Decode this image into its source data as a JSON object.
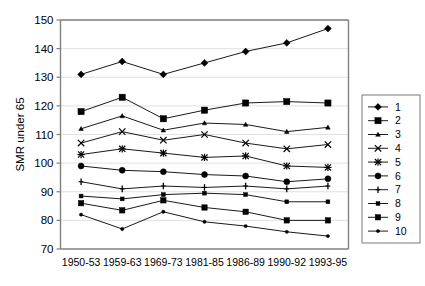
{
  "chart_data": {
    "type": "line",
    "title": "",
    "xlabel": "",
    "ylabel": "SMR under 65",
    "ylim": [
      70,
      150
    ],
    "ytick_step": 10,
    "yticks": [
      70,
      80,
      90,
      100,
      110,
      120,
      130,
      140,
      150
    ],
    "grid": true,
    "legend_position": "right",
    "categories": [
      "1950-53",
      "1959-63",
      "1969-73",
      "1981-85",
      "1986-89",
      "1990-92",
      "1993-95"
    ],
    "series": [
      {
        "name": "1",
        "marker": "diamond",
        "values": [
          131.0,
          135.5,
          131.0,
          135.0,
          139.0,
          142.0,
          147.0
        ]
      },
      {
        "name": "2",
        "marker": "square-large",
        "values": [
          118.0,
          123.0,
          115.5,
          118.5,
          121.0,
          121.5,
          121.0
        ]
      },
      {
        "name": "3",
        "marker": "dot-small",
        "values": [
          112.0,
          116.5,
          111.5,
          114.0,
          113.5,
          111.0,
          112.5
        ]
      },
      {
        "name": "4",
        "marker": "cross-x",
        "values": [
          107.0,
          111.0,
          108.0,
          110.0,
          107.0,
          105.0,
          106.5
        ]
      },
      {
        "name": "5",
        "marker": "asterisk",
        "values": [
          103.0,
          105.0,
          103.5,
          102.0,
          102.5,
          99.0,
          98.5
        ]
      },
      {
        "name": "6",
        "marker": "circle",
        "values": [
          99.0,
          97.5,
          97.0,
          96.0,
          95.5,
          93.5,
          94.5
        ]
      },
      {
        "name": "7",
        "marker": "plus",
        "values": [
          93.5,
          91.0,
          92.0,
          91.5,
          92.0,
          91.0,
          92.0
        ]
      },
      {
        "name": "8",
        "marker": "square-small",
        "values": [
          88.5,
          87.5,
          89.0,
          89.5,
          89.0,
          86.5,
          86.5
        ]
      },
      {
        "name": "9",
        "marker": "square-med",
        "values": [
          86.0,
          83.5,
          87.0,
          84.5,
          83.0,
          80.0,
          80.0
        ]
      },
      {
        "name": "10",
        "marker": "dot-tiny",
        "values": [
          82.0,
          77.0,
          83.0,
          79.5,
          78.0,
          76.0,
          74.5
        ]
      }
    ]
  },
  "legend": {
    "entries": [
      "1",
      "2",
      "3",
      "4",
      "5",
      "6",
      "7",
      "8",
      "9",
      "10"
    ]
  },
  "colors": {
    "series": "#000000",
    "grid": "#d9d9d9",
    "axis": "#808080",
    "background": "#ffffff"
  }
}
